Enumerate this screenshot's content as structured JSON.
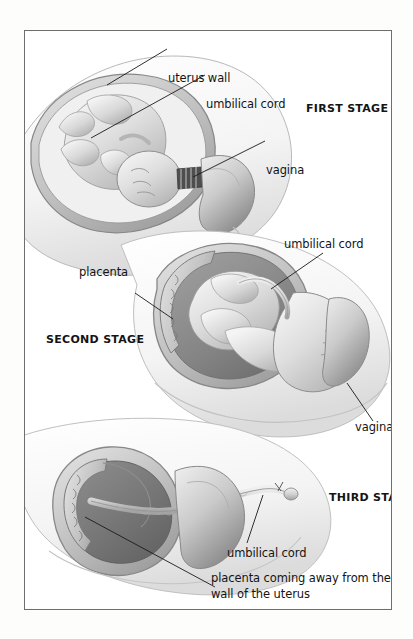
{
  "figure": {
    "frame_border_color": "#6e6e6e",
    "background_color": "#ffffff",
    "page_color": "#fdfdfc"
  },
  "stage_one": {
    "name": "FIRST STAGE",
    "labels": {
      "uterus_wall": "uterus wall",
      "umbilical_cord": "umbilical cord",
      "vagina": "vagina"
    }
  },
  "stage_two": {
    "name": "SECOND STAGE",
    "labels": {
      "umbilical_cord": "umbilical cord",
      "placenta": "placenta",
      "vagina": "vagina"
    }
  },
  "stage_three": {
    "name": "THIRD STAGE",
    "labels": {
      "umbilical_cord": "umbilical cord",
      "placenta_detaching": "placenta coming away from the wall of the uterus"
    }
  },
  "colors": {
    "ink": "#141414",
    "leader_line": "#1a1a1a",
    "tissue_light": "#f2f2f2",
    "tissue_mid": "#c8c8c8",
    "tissue_dark": "#8f8f8f",
    "cavity_dark": "#6f6f6f",
    "cervix_dark": "#4a4a4a"
  }
}
